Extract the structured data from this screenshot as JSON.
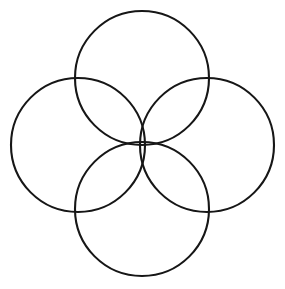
{
  "figure": {
    "canvas": {
      "width": 285,
      "height": 289,
      "background_color": "#ffffff"
    },
    "style": {
      "stroke_color": "#161616",
      "stroke_width": 2.1,
      "fill": "none"
    },
    "center_point": {
      "x": 142,
      "y": 145
    },
    "shapes": [
      {
        "name": "top-circle",
        "label": "Top circle",
        "cx": 142,
        "cy": 78,
        "r": 67
      },
      {
        "name": "left-circle",
        "label": "Left circle",
        "cx": 78,
        "cy": 145,
        "r": 67
      },
      {
        "name": "right-circle",
        "label": "Right circle",
        "cx": 207,
        "cy": 145,
        "r": 67
      },
      {
        "name": "bottom-circle",
        "label": "Bottom circle",
        "cx": 142,
        "cy": 209,
        "r": 67
      }
    ]
  }
}
